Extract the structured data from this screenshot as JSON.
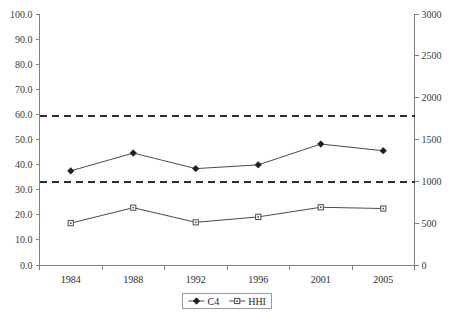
{
  "chart_data": {
    "type": "line",
    "title": "",
    "subtitle": "",
    "xlabel": "",
    "ylabel": "",
    "y2label": "",
    "categories": [
      "1984",
      "1988",
      "1992",
      "1996",
      "2001",
      "2005"
    ],
    "series": [
      {
        "name": "C4",
        "axis": "left",
        "marker": "filled-diamond",
        "values": [
          37.5,
          44.6,
          38.4,
          39.9,
          48.2,
          45.5
        ]
      },
      {
        "name": "HHI",
        "axis": "right",
        "marker": "open-square",
        "values": [
          500,
          685,
          510,
          575,
          690,
          675
        ]
      }
    ],
    "reference_lines": [
      {
        "name": "upper-threshold",
        "left_value": 59.5,
        "right_value": 1800,
        "style": "dashed"
      },
      {
        "name": "lower-threshold",
        "left_value": 33.2,
        "right_value": 1000,
        "style": "dashed"
      }
    ],
    "ylim": [
      0,
      100
    ],
    "y2lim": [
      0,
      3000
    ],
    "yticks": [
      "0.0",
      "10.0",
      "20.0",
      "30.0",
      "40.0",
      "50.0",
      "60.0",
      "70.0",
      "80.0",
      "90.0",
      "100.0"
    ],
    "y2ticks": [
      "0",
      "500",
      "1000",
      "1500",
      "2000",
      "2500",
      "3000"
    ],
    "grid": false,
    "legend_position": "bottom",
    "legend": [
      {
        "label": "C4",
        "marker": "filled-diamond"
      },
      {
        "label": "HHI",
        "marker": "open-square"
      }
    ],
    "colors": {
      "line": "#4b4b4b",
      "axis": "#808080",
      "reference_line": "#2c2c2c",
      "text": "#2b2b2b",
      "background": "#ffffff"
    }
  }
}
